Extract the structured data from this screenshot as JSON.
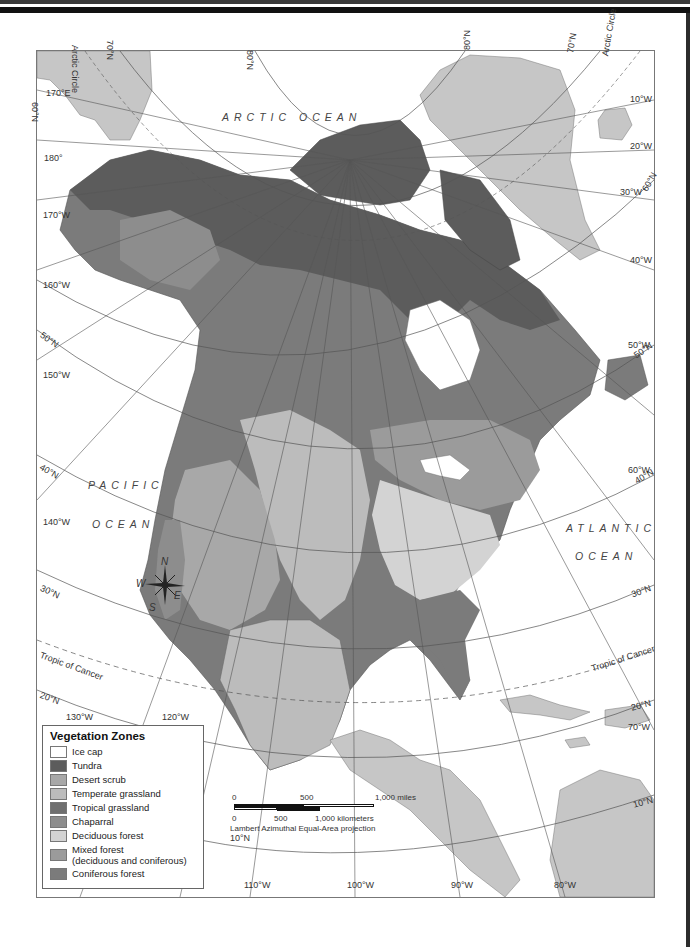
{
  "map": {
    "projection": "Lambert Azimuthal Equal-Area projection",
    "oceans": [
      {
        "name": "ARCTIC OCEAN",
        "x": 222,
        "y": 118
      },
      {
        "name": "PACIFIC",
        "x": 88,
        "y": 479
      },
      {
        "name": "OCEAN",
        "x": 92,
        "y": 518
      },
      {
        "name": "ATLANTIC",
        "x": 566,
        "y": 527
      },
      {
        "name": "OCEAN",
        "x": 575,
        "y": 556
      }
    ],
    "graticule_labels": [
      {
        "text": "70°N",
        "x": 115,
        "y": 40,
        "rot": 90
      },
      {
        "text": "Arctic Circle",
        "x": 80,
        "y": 45,
        "rot": 90
      },
      {
        "text": "170°E",
        "x": 46,
        "y": 88,
        "rot": 0
      },
      {
        "text": "60°N",
        "x": 40,
        "y": 102,
        "rot": 90
      },
      {
        "text": "180°",
        "x": 44,
        "y": 153,
        "rot": 0
      },
      {
        "text": "170°W",
        "x": 43,
        "y": 210,
        "rot": 0
      },
      {
        "text": "160°W",
        "x": 43,
        "y": 280,
        "rot": 0
      },
      {
        "text": "50°N",
        "x": 44,
        "y": 330,
        "rot": 35
      },
      {
        "text": "150°W",
        "x": 43,
        "y": 370,
        "rot": 0
      },
      {
        "text": "40°N",
        "x": 43,
        "y": 462,
        "rot": 30
      },
      {
        "text": "140°W",
        "x": 43,
        "y": 517,
        "rot": 0
      },
      {
        "text": "30°N",
        "x": 43,
        "y": 583,
        "rot": 25
      },
      {
        "text": "Tropic of Cancer",
        "x": 42,
        "y": 650,
        "rot": 20
      },
      {
        "text": "20°N",
        "x": 42,
        "y": 690,
        "rot": 20
      },
      {
        "text": "130°W",
        "x": 66,
        "y": 712,
        "rot": 0
      },
      {
        "text": "120°W",
        "x": 162,
        "y": 712,
        "rot": 0
      },
      {
        "text": "80°N",
        "x": 255,
        "y": 50,
        "rot": 90
      },
      {
        "text": "80°N",
        "x": 462,
        "y": 50,
        "rot": -90
      },
      {
        "text": "70°N",
        "x": 565,
        "y": 52,
        "rot": -80
      },
      {
        "text": "Arctic Circle",
        "x": 600,
        "y": 55,
        "rot": -80
      },
      {
        "text": "10°W",
        "x": 630,
        "y": 94,
        "rot": 0
      },
      {
        "text": "20°W",
        "x": 630,
        "y": 141,
        "rot": 0
      },
      {
        "text": "30°W",
        "x": 620,
        "y": 187,
        "rot": 0
      },
      {
        "text": "60°N",
        "x": 640,
        "y": 188,
        "rot": -60
      },
      {
        "text": "40°W",
        "x": 630,
        "y": 255,
        "rot": 0
      },
      {
        "text": "50°W",
        "x": 628,
        "y": 340,
        "rot": 0
      },
      {
        "text": "50°N",
        "x": 632,
        "y": 352,
        "rot": -35
      },
      {
        "text": "60°W",
        "x": 628,
        "y": 465,
        "rot": 0
      },
      {
        "text": "40°N",
        "x": 633,
        "y": 477,
        "rot": -30
      },
      {
        "text": "30°N",
        "x": 630,
        "y": 590,
        "rot": -20
      },
      {
        "text": "Tropic of Cancer",
        "x": 590,
        "y": 664,
        "rot": -18
      },
      {
        "text": "20°N",
        "x": 630,
        "y": 703,
        "rot": -15
      },
      {
        "text": "70°W",
        "x": 628,
        "y": 722,
        "rot": 0
      },
      {
        "text": "10°N",
        "x": 632,
        "y": 800,
        "rot": -15
      },
      {
        "text": "10°N",
        "x": 230,
        "y": 833,
        "rot": 0
      },
      {
        "text": "110°W",
        "x": 244,
        "y": 880,
        "rot": 0
      },
      {
        "text": "100°W",
        "x": 347,
        "y": 880,
        "rot": 0
      },
      {
        "text": "90°W",
        "x": 451,
        "y": 880,
        "rot": 0
      },
      {
        "text": "80°W",
        "x": 554,
        "y": 880,
        "rot": 0
      }
    ],
    "compass": {
      "n": "N",
      "s": "S",
      "e": "E",
      "w": "W"
    }
  },
  "legend": {
    "title": "Vegetation Zones",
    "items": [
      {
        "label": "Ice cap",
        "color": "#ffffff"
      },
      {
        "label": "Tundra",
        "color": "#5c5c5c"
      },
      {
        "label": "Desert scrub",
        "color": "#a8a8a8"
      },
      {
        "label": "Temperate grassland",
        "color": "#bcbcbc"
      },
      {
        "label": "Tropical grassland",
        "color": "#6f6f6f"
      },
      {
        "label": "Chaparral",
        "color": "#8d8d8d"
      },
      {
        "label": "Deciduous forest",
        "color": "#d3d3d3"
      },
      {
        "label": "Mixed forest\n(deciduous and coniferous)",
        "line1": "Mixed forest",
        "line2": "(deciduous and coniferous)",
        "color": "#9b9b9b"
      },
      {
        "label": "Coniferous forest",
        "color": "#7b7b7b"
      }
    ]
  },
  "scale_bar": {
    "miles_labels": [
      "0",
      "500",
      "1,000 miles"
    ],
    "km_labels": [
      "0",
      "500",
      "1,000 kilometers"
    ],
    "projection_note": "Lambert Azimuthal Equal-Area projection"
  },
  "colors": {
    "land_other": "#c6c6c6",
    "water": "#ffffff",
    "graticule": "#555555",
    "tundra": "#5c5c5c",
    "coniferous": "#7b7b7b",
    "mixed": "#9b9b9b",
    "deciduous": "#d3d3d3",
    "grassland": "#bcbcbc",
    "desert": "#a8a8a8",
    "chaparral": "#8d8d8d",
    "tropical": "#6f6f6f"
  }
}
